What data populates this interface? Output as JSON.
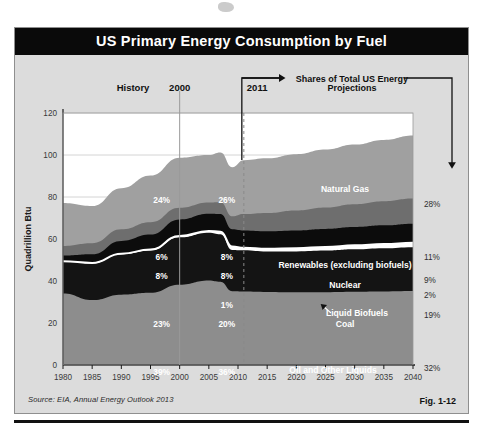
{
  "figure": {
    "title": "US Primary Energy Consumption by Fuel",
    "source": "Source: EIA, Annual Energy Outlook 2013",
    "fig_number": "Fig. 1-12"
  },
  "annotations": {
    "history_label": "History",
    "year_2000_label": "2000",
    "year_2011_label": "2011",
    "bracket_line1": "Shares of Total US Energy",
    "bracket_line2": "Projections"
  },
  "chart_data": {
    "type": "area",
    "title": "US Primary Energy Consumption by Fuel",
    "xlabel": "",
    "ylabel": "Quadrillion Btu",
    "xlim": [
      1980,
      2040
    ],
    "ylim": [
      0,
      120
    ],
    "yticks": [
      0,
      20,
      40,
      60,
      80,
      100,
      120
    ],
    "xticks": [
      1980,
      1985,
      1990,
      1995,
      2000,
      2005,
      2010,
      2015,
      2020,
      2025,
      2030,
      2035,
      2040
    ],
    "grid": true,
    "legend": "in-plot",
    "stack_order_bottom_to_top": [
      "Oil and Other Liquids",
      "Coal",
      "Liquid Biofuels",
      "Nuclear",
      "Renewables (excluding biofuels)",
      "Natural Gas"
    ],
    "x": [
      1980,
      1985,
      1990,
      1995,
      2000,
      2005,
      2007,
      2009,
      2011,
      2015,
      2020,
      2025,
      2030,
      2035,
      2040
    ],
    "series": [
      {
        "name": "Oil and Other Liquids",
        "color": "#8d8d8d",
        "values": [
          34.0,
          30.9,
          33.5,
          34.4,
          38.2,
          40.2,
          39.6,
          35.1,
          35.0,
          34.8,
          34.6,
          34.7,
          34.9,
          35.0,
          35.2
        ]
      },
      {
        "name": "Coal",
        "color": "#141414",
        "values": [
          15.4,
          17.5,
          19.2,
          20.1,
          22.6,
          22.8,
          22.7,
          19.7,
          19.6,
          19.2,
          19.5,
          19.8,
          20.2,
          20.6,
          20.9
        ]
      },
      {
        "name": "Liquid Biofuels",
        "color": "#ffffff",
        "values": [
          0.0,
          0.2,
          0.3,
          0.5,
          0.6,
          0.8,
          1.2,
          1.6,
          1.2,
          1.3,
          1.5,
          1.7,
          1.9,
          2.0,
          2.1
        ]
      },
      {
        "name": "Nuclear",
        "color": "#0c0c0c",
        "values": [
          2.7,
          4.1,
          6.1,
          7.1,
          7.9,
          8.2,
          8.4,
          8.3,
          8.3,
          8.4,
          8.5,
          8.6,
          8.7,
          8.9,
          9.1
        ]
      },
      {
        "name": "Renewables (excluding biofuels)",
        "color": "#6e6e6e",
        "values": [
          4.6,
          5.3,
          5.5,
          5.9,
          5.6,
          5.4,
          5.6,
          6.1,
          7.8,
          8.7,
          9.5,
          10.2,
          10.9,
          11.5,
          12.0
        ]
      },
      {
        "name": "Natural Gas",
        "color": "#a0a0a0",
        "values": [
          20.4,
          17.7,
          19.6,
          22.2,
          23.8,
          22.6,
          23.7,
          23.4,
          25.6,
          26.0,
          26.8,
          27.6,
          28.4,
          29.2,
          30.0
        ]
      }
    ],
    "callout_columns": [
      {
        "year": 2000,
        "labels": [
          {
            "fuel": "Natural Gas",
            "value": "24%"
          },
          {
            "fuel": "Renewables (excluding biofuels)",
            "value": "6%"
          },
          {
            "fuel": "Nuclear",
            "value": "8%"
          },
          {
            "fuel": "Coal",
            "value": "23%"
          },
          {
            "fuel": "Oil and Other Liquids",
            "value": "39%"
          }
        ]
      },
      {
        "year": 2011,
        "labels": [
          {
            "fuel": "Natural Gas",
            "value": "26%"
          },
          {
            "fuel": "Renewables (excluding biofuels)",
            "value": "8%"
          },
          {
            "fuel": "Nuclear",
            "value": "8%"
          },
          {
            "fuel": "Liquid Biofuels",
            "value": "1%"
          },
          {
            "fuel": "Coal",
            "value": "20%"
          },
          {
            "fuel": "Oil and Other Liquids",
            "value": "36%"
          }
        ]
      },
      {
        "year": 2040,
        "labels": [
          {
            "fuel": "Natural Gas",
            "value": "28%"
          },
          {
            "fuel": "Renewables (excluding biofuels)",
            "value": "11%"
          },
          {
            "fuel": "Nuclear",
            "value": "9%"
          },
          {
            "fuel": "Liquid Biofuels",
            "value": "2%"
          },
          {
            "fuel": "Coal",
            "value": "19%"
          },
          {
            "fuel": "Oil and Other Liquids",
            "value": "32%"
          }
        ]
      }
    ],
    "series_labels_in_plot": [
      "Natural Gas",
      "Renewables (excluding biofuels)",
      "Nuclear",
      "Liquid Biofuels",
      "Coal",
      "Oil and Other Liquids"
    ]
  }
}
